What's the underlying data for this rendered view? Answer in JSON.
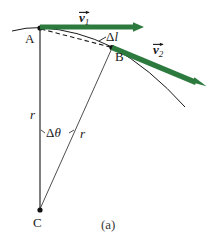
{
  "figure": {
    "caption": "(a)",
    "colors": {
      "vector_green": "#2d7a3e",
      "line_black": "#1a1a1a",
      "background": "#ffffff"
    },
    "points": [
      {
        "name": "A",
        "label": "A",
        "x": 40,
        "y": 28
      },
      {
        "name": "B",
        "label": "B",
        "x": 112,
        "y": 47
      },
      {
        "name": "C",
        "label": "C",
        "x": 40,
        "y": 210
      }
    ],
    "vectors": [
      {
        "name": "v1",
        "label_body": "v",
        "label_sub": "1",
        "from": {
          "x": 40,
          "y": 27
        },
        "to": {
          "x": 143,
          "y": 27
        }
      },
      {
        "name": "v2",
        "label_body": "v",
        "label_sub": "2",
        "from": {
          "x": 112,
          "y": 47
        },
        "to": {
          "x": 206,
          "y": 86
        }
      }
    ],
    "annotations": [
      {
        "name": "delta-l",
        "symbol": "Δ",
        "variable": "l"
      },
      {
        "name": "delta-theta",
        "symbol": "Δ",
        "variable": "θ"
      },
      {
        "name": "radius-left",
        "variable": "r"
      },
      {
        "name": "radius-right",
        "variable": "r"
      }
    ]
  }
}
